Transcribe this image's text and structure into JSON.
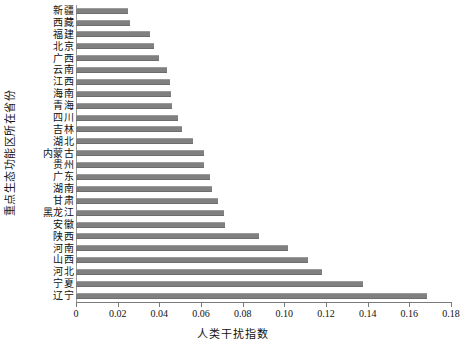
{
  "chart_data": {
    "type": "bar",
    "orientation": "horizontal",
    "title": "",
    "xlabel": "人类干扰指数",
    "ylabel": "重点生态功能区所在省份",
    "xlim": [
      0,
      0.18
    ],
    "ylim": null,
    "grid": false,
    "legend": null,
    "bar_color": "#808080",
    "xticks": [
      "0",
      "0.02",
      "0.04",
      "0.06",
      "0.08",
      "0.10",
      "0.12",
      "0.14",
      "0.16",
      "0.18"
    ],
    "xtick_values": [
      0,
      0.02,
      0.04,
      0.06,
      0.08,
      0.1,
      0.12,
      0.14,
      0.16,
      0.18
    ],
    "categories": [
      "新疆",
      "西藏",
      "福建",
      "北京",
      "广西",
      "云南",
      "江西",
      "海南",
      "青海",
      "四川",
      "吉林",
      "湖北",
      "内蒙古",
      "贵州",
      "广东",
      "湖南",
      "甘肃",
      "黑龙江",
      "安徽",
      "陕西",
      "河南",
      "山西",
      "河北",
      "宁夏",
      "辽宁"
    ],
    "values": [
      0.025,
      0.026,
      0.0355,
      0.0375,
      0.04,
      0.0437,
      0.045,
      0.0455,
      0.046,
      0.049,
      0.051,
      0.056,
      0.0615,
      0.0615,
      0.0645,
      0.0652,
      0.0683,
      0.071,
      0.0715,
      0.0876,
      0.1019,
      0.1112,
      0.118,
      0.1378,
      0.1683
    ]
  },
  "axis": {
    "x_title": "人类干扰指数",
    "y_title": "重点生态功能区所在省份"
  }
}
